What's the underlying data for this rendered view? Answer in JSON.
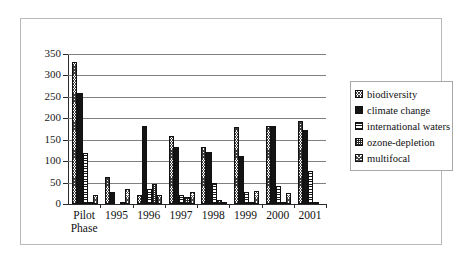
{
  "chart_data": {
    "type": "bar",
    "title": "",
    "xlabel": "",
    "ylabel": "",
    "ylim": [
      0,
      350
    ],
    "yticks": [
      0,
      50,
      100,
      150,
      200,
      250,
      300,
      350
    ],
    "grid": true,
    "legend_position": "right",
    "categories": [
      "Pilot\nPhase",
      "1995",
      "1996",
      "1997",
      "1998",
      "1999",
      "2000",
      "2001"
    ],
    "series": [
      {
        "name": "biodiversity",
        "pattern": "crosshatch-diagonal",
        "values": [
          332,
          62,
          21,
          159,
          134,
          179,
          181,
          194
        ]
      },
      {
        "name": "climate change",
        "pattern": "solid-black",
        "values": [
          258,
          29,
          181,
          134,
          122,
          112,
          182,
          173
        ]
      },
      {
        "name": "international waters",
        "pattern": "horizontal-lines",
        "values": [
          118,
          0,
          35,
          21,
          49,
          29,
          41,
          76
        ]
      },
      {
        "name": "ozone-depletion",
        "pattern": "dense-grid",
        "values": [
          5,
          2,
          46,
          17,
          10,
          3,
          4,
          5
        ]
      },
      {
        "name": "multifocal",
        "pattern": "crosshatch-light",
        "values": [
          20,
          36,
          21,
          27,
          1,
          31,
          26,
          0
        ]
      }
    ]
  },
  "legend": {
    "items": [
      {
        "label": "biodiversity"
      },
      {
        "label": "climate change"
      },
      {
        "label": "international waters"
      },
      {
        "label": "ozone-depletion"
      },
      {
        "label": "multifocal"
      }
    ]
  },
  "colors": {
    "frame_border": "#b9b9b9",
    "axis": "#2b2b2b",
    "gridline": "#808080",
    "bar_outline": "#111111",
    "text": "#111111",
    "background": "#ffffff"
  }
}
